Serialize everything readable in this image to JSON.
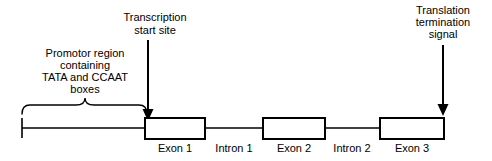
{
  "diagram": {
    "background_color": "#ffffff",
    "stroke_color": "#000000",
    "annotations": {
      "transcription": {
        "lines": [
          "Transcription",
          "start site"
        ],
        "line1": "Transcription",
        "line2": "start site",
        "arrow_x": 148,
        "arrow_top_y": 40,
        "arrow_bottom_y": 121
      },
      "translation": {
        "lines": [
          "Translation",
          "termination",
          "signal"
        ],
        "line1": "Translation",
        "line2": "termination",
        "line3": "signal",
        "arrow_x": 443,
        "arrow_top_y": 45,
        "arrow_bottom_y": 116
      },
      "promotor": {
        "lines": [
          "Promotor region",
          "containing",
          "TATA and CCAAT",
          "boxes"
        ],
        "line1": "Promotor region",
        "line2": "containing",
        "line3": "TATA and CCAAT",
        "line4": "boxes",
        "brace_left_x": 22,
        "brace_right_x": 147,
        "brace_y": 107
      }
    },
    "backbone": {
      "start_x": 22,
      "end_x": 444,
      "y": 128,
      "terminus_tick_top_y": 118,
      "terminus_tick_bottom_y": 138
    },
    "features": [
      {
        "label": "Exon 1",
        "type": "exon",
        "x": 145,
        "width": 60,
        "label_x": 175
      },
      {
        "label": "Intron 1",
        "type": "intron",
        "x": 205,
        "width": 58,
        "label_x": 234
      },
      {
        "label": "Exon 2",
        "type": "exon",
        "x": 263,
        "width": 62,
        "label_x": 294
      },
      {
        "label": "Intron 2",
        "type": "intron",
        "x": 325,
        "width": 55,
        "label_x": 352
      },
      {
        "label": "Exon 3",
        "type": "exon",
        "x": 380,
        "width": 64,
        "label_x": 412
      }
    ],
    "exon_box": {
      "top_y": 118,
      "height": 21
    },
    "feature_label_y": 152
  }
}
